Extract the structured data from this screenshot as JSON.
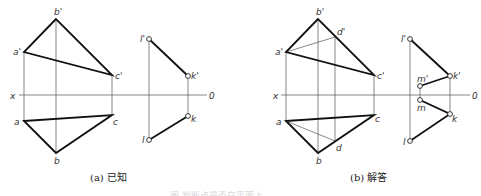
{
  "figure_a": {
    "caption": "(a) 已知",
    "labels": {
      "b_prime": "b'",
      "a_prime": "a'",
      "c_prime": "c'",
      "a": "a",
      "b": "b",
      "c": "c",
      "x": "x",
      "origin": "0",
      "l_prime": "l'",
      "k_prime": "k'",
      "l": "l",
      "k": "k"
    }
  },
  "figure_b": {
    "caption": "(b) 解答",
    "labels": {
      "b_prime": "b'",
      "a_prime": "a'",
      "c_prime": "c'",
      "d_prime": "d'",
      "a": "a",
      "b": "b",
      "c": "c",
      "d": "d",
      "x": "x",
      "origin": "0",
      "l_prime": "l'",
      "k_prime": "k'",
      "m_prime": "m'",
      "l": "l",
      "k": "k",
      "m": "m"
    }
  },
  "figure_caption": "图 判断点是否在平面上"
}
